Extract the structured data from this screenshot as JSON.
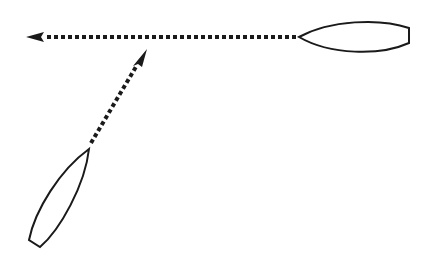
{
  "diagram": {
    "background": "#ffffff",
    "stroke_color": "#1a1a1a",
    "boats": [
      {
        "id": "boat-right",
        "orientation": "horizontal",
        "bow_direction": "left"
      },
      {
        "id": "boat-lower-left",
        "orientation": "diagonal",
        "bow_direction": "up-right"
      }
    ],
    "arrows": [
      {
        "id": "course-arrow-horizontal",
        "from": "boat-right bow",
        "direction": "left",
        "style": "dotted"
      },
      {
        "id": "course-arrow-diagonal",
        "from": "boat-lower-left bow",
        "direction": "up-right",
        "style": "dotted"
      }
    ]
  }
}
